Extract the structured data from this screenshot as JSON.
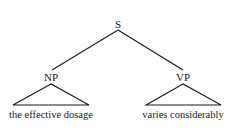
{
  "tree": {
    "root": {
      "label": "S"
    },
    "children": [
      {
        "label": "NP",
        "leaf": "the effective dosage",
        "collapsed": true
      },
      {
        "label": "VP",
        "leaf": "varies considerably",
        "collapsed": true
      }
    ]
  },
  "colors": {
    "ink": "#1a1a1a",
    "background": "#ffffff"
  }
}
